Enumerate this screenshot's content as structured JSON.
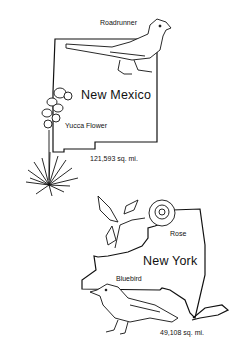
{
  "new_mexico": {
    "state_name": "New Mexico",
    "bird_label": "Roadrunner",
    "flower_label": "Yucca Flower",
    "area": "121,593 sq. mi."
  },
  "new_york": {
    "state_name": "New York",
    "bird_label": "Bluebird",
    "flower_label": "Rose",
    "area": "49,108 sq. mi."
  }
}
